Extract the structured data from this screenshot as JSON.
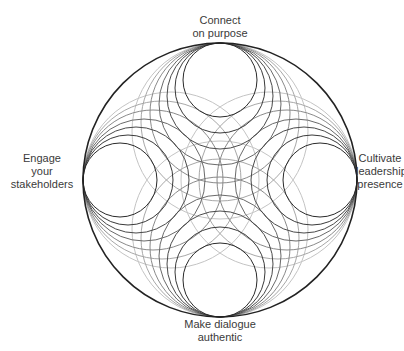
{
  "diagram": {
    "type": "nested-tangent-circles",
    "outer_circle": {
      "cx": 220,
      "cy": 180,
      "r": 137,
      "stroke": "#222222"
    },
    "ring_radii": [
      37,
      45,
      53,
      61,
      70,
      79,
      88
    ],
    "ring_strokes": [
      "#2a2a2a",
      "#3a3a3a",
      "#4a4a4a",
      "#6a6a6a",
      "#8a8a8a",
      "#a8a8a8",
      "#c4c4c4"
    ]
  },
  "labels": {
    "top": {
      "line1": "Connect",
      "line2": "on purpose"
    },
    "left": {
      "line1": "Engage",
      "line2": "your",
      "line3": "stakeholders"
    },
    "right": {
      "line1": "Cultivate",
      "line2": "leadership",
      "line3": "presence"
    },
    "bottom": {
      "line1": "Make dialogue",
      "line2": "authentic"
    }
  }
}
